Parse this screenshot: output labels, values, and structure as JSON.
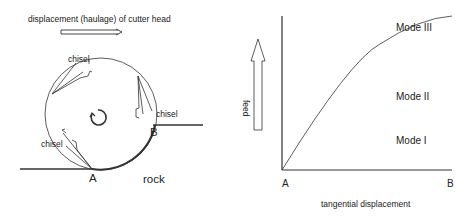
{
  "left_panel": {
    "title": "displacement (haulage) of cutter head",
    "chisel_labels": [
      "chisel",
      "chisel",
      "chisel"
    ],
    "point_a": "A",
    "point_b": "B",
    "rock_label": "rock",
    "rotation": "counterclockwise"
  },
  "right_panel": {
    "y_label": "feed",
    "x_label": "tangential displacement",
    "x_start": "A",
    "x_end": "B",
    "modes": [
      "Mode III",
      "Mode II",
      "Mode I"
    ]
  },
  "colors": {
    "line": "#333333",
    "text": "#222222",
    "background": "#ffffff"
  }
}
